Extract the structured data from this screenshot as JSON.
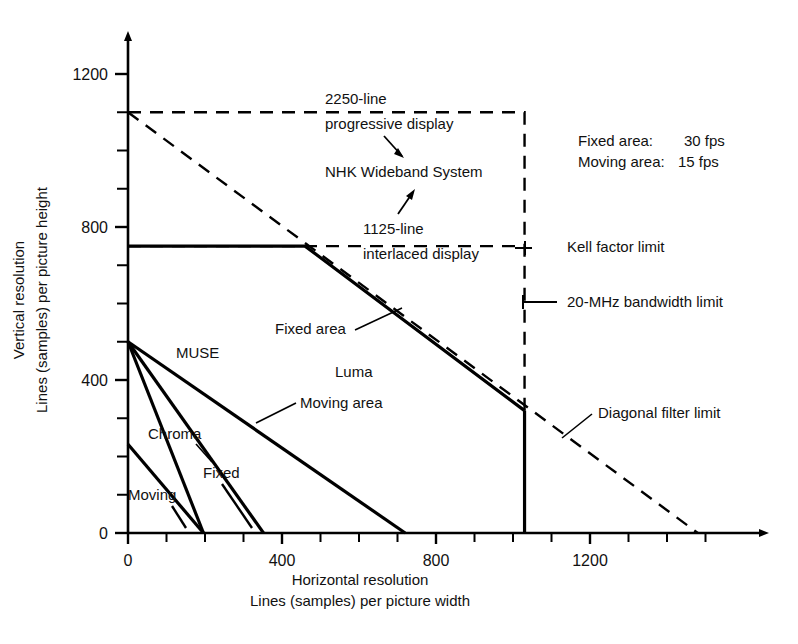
{
  "chart_data": {
    "type": "line",
    "title": "",
    "xlabel": "Horizontal resolution",
    "xlabel2": "Lines (samples) per picture width",
    "ylabel": "Vertical resolution",
    "ylabel2": "Lines (samples) per picture height",
    "xlim": [
      0,
      1560
    ],
    "ylim": [
      0,
      1260
    ],
    "xticks": [
      0,
      100,
      200,
      300,
      400,
      500,
      600,
      700,
      800,
      900,
      1000,
      1100,
      1200,
      1300,
      1400,
      1500
    ],
    "yticks": [
      0,
      100,
      200,
      300,
      400,
      500,
      600,
      700,
      800,
      900,
      1000,
      1100,
      1200
    ],
    "xtick_labels": [
      {
        "value": 0,
        "text": "0"
      },
      {
        "value": 400,
        "text": "400"
      },
      {
        "value": 800,
        "text": "800"
      },
      {
        "value": 1200,
        "text": "1200"
      }
    ],
    "ytick_labels": [
      {
        "value": 0,
        "text": "0"
      },
      {
        "value": 400,
        "text": "400"
      },
      {
        "value": 800,
        "text": "800"
      },
      {
        "value": 1200,
        "text": "1200"
      }
    ],
    "grid": false,
    "legend": "none",
    "series": [
      {
        "name": "NHK Wideband System - 2250-line progressive display envelope",
        "style": "dashed",
        "points": [
          [
            0,
            1100
          ],
          [
            1030,
            1100
          ],
          [
            1030,
            0
          ]
        ]
      },
      {
        "name": "NHK Wideband System - diagonal filter limit",
        "style": "dashed",
        "points": [
          [
            0,
            1100
          ],
          [
            1480,
            0
          ]
        ]
      },
      {
        "name": "1125-line interlaced display - Kell factor limit",
        "style": "dashed",
        "points": [
          [
            0,
            750
          ],
          [
            1030,
            750
          ]
        ]
      },
      {
        "name": "Luma fixed area",
        "style": "solid",
        "points": [
          [
            0,
            750
          ],
          [
            460,
            750
          ],
          [
            1030,
            320
          ]
        ]
      },
      {
        "name": "20-MHz bandwidth limit",
        "style": "solid",
        "points": [
          [
            1030,
            320
          ],
          [
            1030,
            0
          ]
        ]
      },
      {
        "name": "MUSE luma moving area",
        "style": "solid",
        "points": [
          [
            0,
            500
          ],
          [
            720,
            0
          ]
        ]
      },
      {
        "name": "MUSE luma fixed area",
        "style": "solid",
        "points": [
          [
            0,
            500
          ],
          [
            352,
            0
          ]
        ]
      },
      {
        "name": "MUSE chroma fixed",
        "style": "solid",
        "points": [
          [
            0,
            500
          ],
          [
            196,
            0
          ]
        ]
      },
      {
        "name": "MUSE chroma moving",
        "style": "solid",
        "points": [
          [
            0,
            232
          ],
          [
            196,
            0
          ]
        ]
      }
    ],
    "annotations": [
      {
        "id": "label-2250-line",
        "text": "2250-line",
        "x": 325,
        "y": 104
      },
      {
        "id": "label-progressive-display",
        "text": "progressive display",
        "x": 325,
        "y": 129
      },
      {
        "id": "label-nhk-wideband-system",
        "text": "NHK Wideband System",
        "x": 325,
        "y": 177
      },
      {
        "id": "label-1125-line",
        "text": "1125-line",
        "x": 363,
        "y": 234
      },
      {
        "id": "label-interlaced-display",
        "text": "interlaced display",
        "x": 363,
        "y": 259
      },
      {
        "id": "label-kell-factor-limit",
        "text": "Kell factor limit",
        "x": 567,
        "y": 252
      },
      {
        "id": "label-20-mhz-bandwidth-limit",
        "text": "20-MHz bandwidth limit",
        "x": 567,
        "y": 307
      },
      {
        "id": "label-diagonal-filter-limit",
        "text": "Diagonal filter limit",
        "x": 598,
        "y": 418
      },
      {
        "id": "label-fixed-area",
        "text": "Fixed area",
        "x": 275,
        "y": 334
      },
      {
        "id": "label-luma",
        "text": "Luma",
        "x": 335,
        "y": 377
      },
      {
        "id": "label-moving-area",
        "text": "Moving area",
        "x": 300,
        "y": 408
      },
      {
        "id": "label-muse",
        "text": "MUSE",
        "x": 176,
        "y": 358
      },
      {
        "id": "label-chroma",
        "text": "Chroma",
        "x": 148,
        "y": 439
      },
      {
        "id": "label-fixed",
        "text": "Fixed",
        "x": 203,
        "y": 478
      },
      {
        "id": "label-moving",
        "text": "Moving",
        "x": 128,
        "y": 500
      }
    ],
    "notes": [
      {
        "id": "note-fixed-area-fps",
        "label": "Fixed area:",
        "value": "30 fps"
      },
      {
        "id": "note-moving-area-fps",
        "label": "Moving area:",
        "value": "15 fps"
      }
    ],
    "colors": {
      "line": "#000000",
      "text": "#111111",
      "background": "#ffffff"
    }
  }
}
